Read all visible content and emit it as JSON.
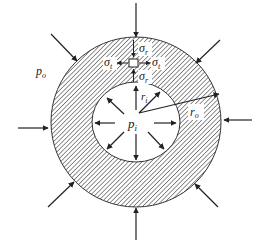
{
  "diagram": {
    "type": "thick-walled cylinder cross-section under internal and external pressure",
    "labels": {
      "outer_pressure": "p",
      "outer_pressure_sub": "o",
      "inner_pressure": "p",
      "inner_pressure_sub": "i",
      "inner_radius": "r",
      "inner_radius_sub": "i",
      "outer_radius": "r",
      "outer_radius_sub": "o",
      "radial_stress": "σ",
      "radial_stress_sub": "r",
      "tangential_stress": "σ",
      "tangential_stress_sub": "t"
    },
    "colors": {
      "stroke": "#333333",
      "hatch": "#555555",
      "background": "#ffffff"
    },
    "geometry": {
      "center": [
        136,
        122
      ],
      "outer_radius": 85,
      "inner_rx": 44,
      "inner_ry": 40,
      "outer_arrow_count": 8,
      "inner_arrow_count": 8
    }
  }
}
